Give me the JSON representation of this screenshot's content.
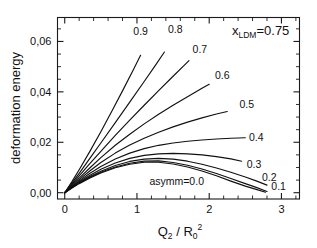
{
  "chart_data": {
    "type": "line",
    "title": "",
    "xlabel": "Q2 / R0^2",
    "ylabel": "deformation energy",
    "xlim": [
      -0.1,
      3.25
    ],
    "ylim": [
      -0.0025,
      0.0695
    ],
    "grid": false,
    "legend_position": "inline-curve-labels",
    "x_ticks": [
      "0",
      "1",
      "2",
      "3"
    ],
    "x_tick_values": [
      0,
      1,
      2,
      3
    ],
    "x_minor_step": 0.2,
    "y_ticks": [
      "0,00",
      "0,02",
      "0,04",
      "0,06"
    ],
    "y_tick_values": [
      0.0,
      0.02,
      0.04,
      0.06
    ],
    "y_minor_step": 0.005,
    "annotation": "x_LDM=0.75",
    "annotation_parts": {
      "symbol": "x",
      "subscript": "LDM",
      "equals_value": "=0.75"
    },
    "series_label_prefix": "asymm=",
    "series": [
      {
        "name": "0.0",
        "label": "asymm=0.0",
        "label_x": 1.55,
        "label_y": 0.0045,
        "points": [
          [
            0,
            0
          ],
          [
            0.1,
            0.0019
          ],
          [
            0.2,
            0.0036
          ],
          [
            0.35,
            0.0058
          ],
          [
            0.5,
            0.0078
          ],
          [
            0.7,
            0.0099
          ],
          [
            0.9,
            0.0113
          ],
          [
            1.1,
            0.0121
          ],
          [
            1.3,
            0.0121
          ],
          [
            1.5,
            0.0114
          ],
          [
            1.7,
            0.0102
          ],
          [
            1.9,
            0.0086
          ],
          [
            2.1,
            0.0067
          ],
          [
            2.3,
            0.0046
          ],
          [
            2.5,
            0.0026
          ],
          [
            2.65,
            0.0013
          ],
          [
            2.78,
            0.0002
          ]
        ]
      },
      {
        "name": "0.1",
        "label": "0.1",
        "label_x": 2.86,
        "label_y": 0.0028,
        "points": [
          [
            0,
            0
          ],
          [
            0.1,
            0.002
          ],
          [
            0.2,
            0.0038
          ],
          [
            0.35,
            0.0061
          ],
          [
            0.5,
            0.0081
          ],
          [
            0.7,
            0.0102
          ],
          [
            0.9,
            0.0117
          ],
          [
            1.1,
            0.0125
          ],
          [
            1.3,
            0.0126
          ],
          [
            1.5,
            0.012
          ],
          [
            1.7,
            0.0109
          ],
          [
            1.9,
            0.0094
          ],
          [
            2.1,
            0.0076
          ],
          [
            2.3,
            0.0056
          ],
          [
            2.5,
            0.0036
          ],
          [
            2.65,
            0.0021
          ],
          [
            2.8,
            0.0005
          ]
        ]
      },
      {
        "name": "0.2",
        "label": "0.2",
        "label_x": 2.73,
        "label_y": 0.0062,
        "points": [
          [
            0,
            0
          ],
          [
            0.1,
            0.0021
          ],
          [
            0.2,
            0.004
          ],
          [
            0.35,
            0.0064
          ],
          [
            0.5,
            0.0085
          ],
          [
            0.7,
            0.0108
          ],
          [
            0.9,
            0.0124
          ],
          [
            1.1,
            0.0133
          ],
          [
            1.3,
            0.0136
          ],
          [
            1.5,
            0.0133
          ],
          [
            1.7,
            0.0125
          ],
          [
            1.9,
            0.0113
          ],
          [
            2.1,
            0.0098
          ],
          [
            2.3,
            0.0081
          ],
          [
            2.5,
            0.0062
          ],
          [
            2.65,
            0.0047
          ],
          [
            2.8,
            0.003
          ]
        ]
      },
      {
        "name": "0.3",
        "label": "0.3",
        "label_x": 2.52,
        "label_y": 0.0112,
        "points": [
          [
            0,
            0
          ],
          [
            0.1,
            0.0022
          ],
          [
            0.2,
            0.0043
          ],
          [
            0.35,
            0.0069
          ],
          [
            0.5,
            0.0093
          ],
          [
            0.7,
            0.0118
          ],
          [
            0.9,
            0.0136
          ],
          [
            1.1,
            0.0148
          ],
          [
            1.3,
            0.0154
          ],
          [
            1.5,
            0.0156
          ],
          [
            1.7,
            0.0154
          ],
          [
            1.9,
            0.015
          ],
          [
            2.1,
            0.0143
          ],
          [
            2.3,
            0.0134
          ],
          [
            2.45,
            0.0125
          ]
        ]
      },
      {
        "name": "0.4",
        "label": "0.4",
        "label_x": 2.55,
        "label_y": 0.0222,
        "points": [
          [
            0,
            0
          ],
          [
            0.1,
            0.0024
          ],
          [
            0.2,
            0.0047
          ],
          [
            0.35,
            0.0077
          ],
          [
            0.5,
            0.0104
          ],
          [
            0.7,
            0.0134
          ],
          [
            0.9,
            0.0157
          ],
          [
            1.1,
            0.0175
          ],
          [
            1.3,
            0.0188
          ],
          [
            1.5,
            0.0197
          ],
          [
            1.7,
            0.0204
          ],
          [
            1.9,
            0.0209
          ],
          [
            2.1,
            0.0213
          ],
          [
            2.3,
            0.0216
          ],
          [
            2.5,
            0.0218
          ]
        ]
      },
      {
        "name": "0.5",
        "label": "0.5",
        "label_x": 2.42,
        "label_y": 0.0352,
        "points": [
          [
            0,
            0
          ],
          [
            0.1,
            0.0026
          ],
          [
            0.2,
            0.0052
          ],
          [
            0.35,
            0.0087
          ],
          [
            0.5,
            0.012
          ],
          [
            0.7,
            0.0157
          ],
          [
            0.9,
            0.0189
          ],
          [
            1.1,
            0.0216
          ],
          [
            1.3,
            0.024
          ],
          [
            1.5,
            0.0261
          ],
          [
            1.7,
            0.028
          ],
          [
            1.9,
            0.0297
          ],
          [
            2.1,
            0.0312
          ],
          [
            2.25,
            0.0322
          ]
        ]
      },
      {
        "name": "0.6",
        "label": "0.6",
        "label_x": 2.08,
        "label_y": 0.0466,
        "points": [
          [
            0,
            0
          ],
          [
            0.1,
            0.0029
          ],
          [
            0.2,
            0.0058
          ],
          [
            0.35,
            0.0099
          ],
          [
            0.5,
            0.0139
          ],
          [
            0.7,
            0.0188
          ],
          [
            0.9,
            0.0232
          ],
          [
            1.1,
            0.0273
          ],
          [
            1.3,
            0.0311
          ],
          [
            1.5,
            0.0347
          ],
          [
            1.7,
            0.0381
          ],
          [
            1.9,
            0.0414
          ],
          [
            2.0,
            0.043
          ]
        ]
      },
      {
        "name": "0.7",
        "label": "0.7",
        "label_x": 1.77,
        "label_y": 0.0572,
        "points": [
          [
            0,
            0
          ],
          [
            0.1,
            0.0033
          ],
          [
            0.2,
            0.0067
          ],
          [
            0.35,
            0.0116
          ],
          [
            0.5,
            0.0164
          ],
          [
            0.7,
            0.0227
          ],
          [
            0.9,
            0.0288
          ],
          [
            1.1,
            0.0347
          ],
          [
            1.3,
            0.0405
          ],
          [
            1.5,
            0.0462
          ],
          [
            1.65,
            0.0504
          ],
          [
            1.72,
            0.0524
          ]
        ]
      },
      {
        "name": "0.8",
        "label": "0.8",
        "label_x": 1.43,
        "label_y": 0.065,
        "points": [
          [
            0,
            0
          ],
          [
            0.1,
            0.0038
          ],
          [
            0.2,
            0.0077
          ],
          [
            0.35,
            0.0137
          ],
          [
            0.5,
            0.0197
          ],
          [
            0.7,
            0.0278
          ],
          [
            0.9,
            0.0359
          ],
          [
            1.1,
            0.0441
          ],
          [
            1.25,
            0.0503
          ],
          [
            1.38,
            0.0558
          ]
        ]
      },
      {
        "name": "0.9",
        "label": "0.9",
        "label_x": 0.95,
        "label_y": 0.0642,
        "points": [
          [
            0,
            0
          ],
          [
            0.1,
            0.0044
          ],
          [
            0.2,
            0.0091
          ],
          [
            0.35,
            0.0165
          ],
          [
            0.5,
            0.0242
          ],
          [
            0.65,
            0.0322
          ],
          [
            0.8,
            0.0404
          ],
          [
            0.95,
            0.0488
          ],
          [
            1.05,
            0.0545
          ]
        ]
      }
    ]
  }
}
